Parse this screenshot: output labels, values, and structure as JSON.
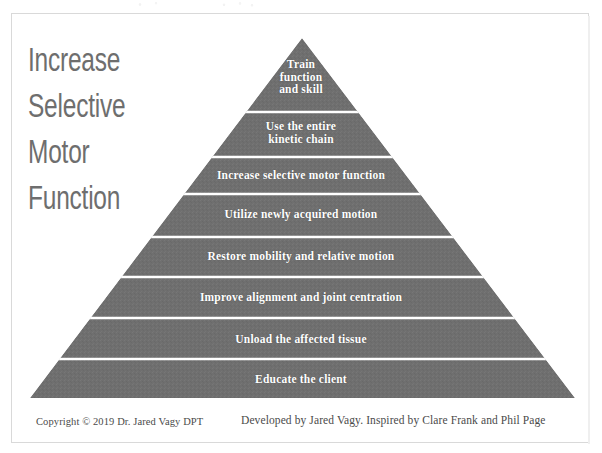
{
  "document": {
    "title": "Increase Selective Motor Function",
    "background_color": "#ffffff",
    "frame_color": "#d9d9d9"
  },
  "heading": {
    "lines": [
      "Increase",
      "Selective",
      "Motor",
      "Function"
    ],
    "color": "#6e6e6e"
  },
  "pyramid": {
    "fill_color": "#6f6f6f",
    "divider_color": "#ffffff",
    "text_color": "#ffffff",
    "apex": {
      "x": 302,
      "y": 38
    },
    "base": {
      "left_x": 30,
      "right_x": 575,
      "y": 398
    },
    "tiers": [
      {
        "index": 1,
        "label": "Train function and skill",
        "lines": [
          "Train",
          "function",
          "and skill"
        ],
        "top_y": 38,
        "bottom_y": 112
      },
      {
        "index": 2,
        "label": "Use the entire kinetic chain",
        "lines": [
          "Use the entire",
          "kinetic chain"
        ],
        "top_y": 112,
        "bottom_y": 157
      },
      {
        "index": 3,
        "label": "Increase selective motor function",
        "lines": [
          "Increase selective motor function"
        ],
        "top_y": 157,
        "bottom_y": 194
      },
      {
        "index": 4,
        "label": "Utilize newly acquired motion",
        "lines": [
          "Utilize newly acquired motion"
        ],
        "top_y": 194,
        "bottom_y": 237
      },
      {
        "index": 5,
        "label": "Restore mobility and relative motion",
        "lines": [
          "Restore mobility and relative motion"
        ],
        "top_y": 237,
        "bottom_y": 277
      },
      {
        "index": 6,
        "label": "Improve alignment and joint centration",
        "lines": [
          "Improve alignment and joint centration"
        ],
        "top_y": 277,
        "bottom_y": 318
      },
      {
        "index": 7,
        "label": "Unload the affected tissue",
        "lines": [
          "Unload the affected tissue"
        ],
        "top_y": 318,
        "bottom_y": 359
      },
      {
        "index": 8,
        "label": "Educate the client",
        "lines": [
          "Educate the client"
        ],
        "top_y": 359,
        "bottom_y": 398
      }
    ]
  },
  "footer": {
    "copyright": "Copyright © 2019 Dr. Jared Vagy DPT",
    "credit": "Developed by Jared Vagy. Inspired by Clare Frank and Phil Page"
  }
}
